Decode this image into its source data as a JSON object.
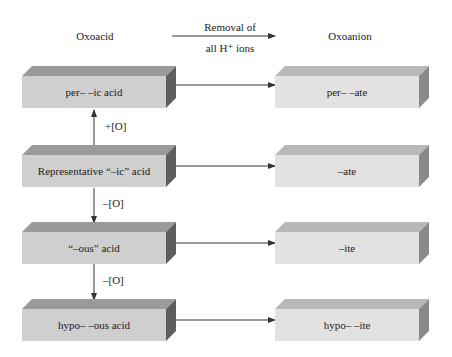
{
  "header": {
    "left_title": "Oxoacid",
    "arrow_label_line1": "Removal of",
    "arrow_label_line2": "all H⁺ ions",
    "right_title": "Oxoanion"
  },
  "acids": [
    {
      "label": "per– –ic acid"
    },
    {
      "label": "Representative “–ic” acid"
    },
    {
      "label": "“–ous” acid"
    },
    {
      "label": "hypo– –ous acid"
    }
  ],
  "anions": [
    {
      "label": "per– –ate"
    },
    {
      "label": "–ate"
    },
    {
      "label": "–ite"
    },
    {
      "label": "hypo– –ite"
    }
  ],
  "vertical_labels": [
    "+[O]",
    "–[O]",
    "–[O]"
  ],
  "colors": {
    "acid_front": "#cfcfcf",
    "acid_top": "#9a9a9a",
    "acid_side": "#5e5e5e",
    "anion_front": "#e2e2e2",
    "anion_top": "#b8b8b8",
    "anion_side": "#8a8a8a",
    "line": "#333333"
  }
}
